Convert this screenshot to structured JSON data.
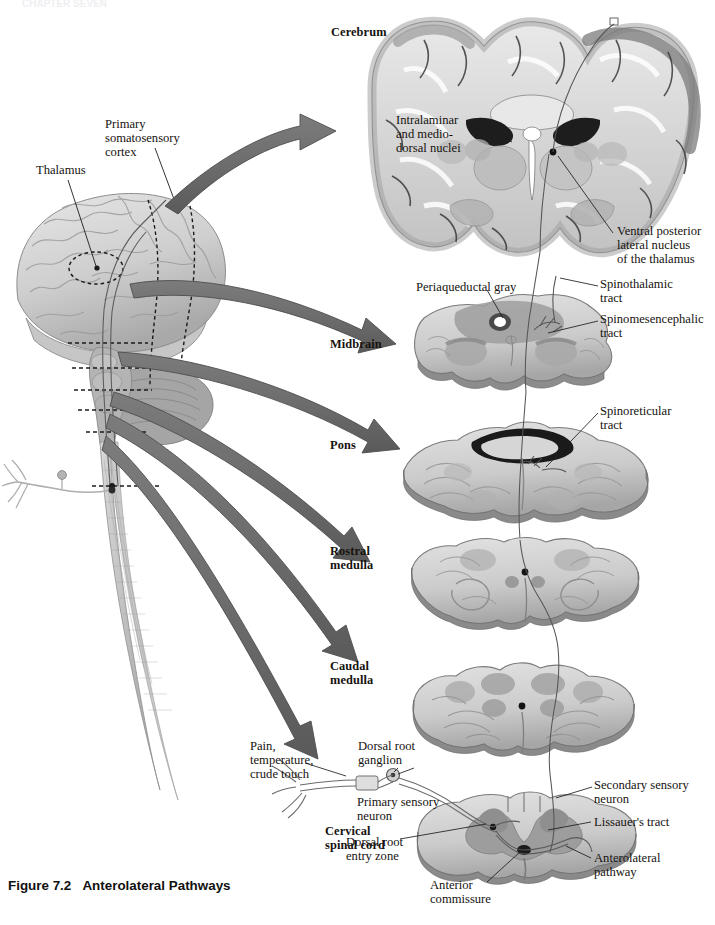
{
  "page": {
    "header_faint": "CHAPTER SEVEN",
    "caption_figure": "Figure 7.2",
    "caption_title": "Anterolateral Pathways",
    "background": "#ffffff"
  },
  "colors": {
    "arrow_fill": "#6f6f6f",
    "arrow_stroke": "#4a4a4a",
    "tissue_light": "#d9d9d9",
    "tissue_mid": "#bcbcbc",
    "tissue_dark": "#9a9a9a",
    "tissue_darker": "#7d7d7d",
    "leader_line": "#2b2b2b",
    "tract_line": "#555555",
    "text": "#16130f"
  },
  "brain_overview": {
    "name": "sagittal-brain-spinal-cord",
    "labels": [
      {
        "id": "thalamus",
        "text": "Thalamus",
        "x": 36,
        "y": 170
      },
      {
        "id": "primary-somatosensory-cortex",
        "text": "Primary\nsomatosensory\ncortex",
        "x": 105,
        "y": 122
      }
    ]
  },
  "level_labels": [
    {
      "id": "cerebrum",
      "text": "Cerebrum",
      "x": 331,
      "y": 30
    },
    {
      "id": "midbrain",
      "text": "Midbrain",
      "x": 330,
      "y": 340
    },
    {
      "id": "pons",
      "text": "Pons",
      "x": 330,
      "y": 440
    },
    {
      "id": "rostral-medulla",
      "text": "Rostral\nmedulla",
      "x": 330,
      "y": 548
    },
    {
      "id": "caudal-medulla",
      "text": "Caudal\nmedulla",
      "x": 330,
      "y": 663
    },
    {
      "id": "cervical-spinal-cord",
      "text": "Cervical\nspinal cord",
      "x": 325,
      "y": 828
    }
  ],
  "structure_labels": [
    {
      "id": "intralaminar-mediodorsal-nuclei",
      "text": "Intralaminar\nand medio-\ndorsal nuclei",
      "x": 396,
      "y": 118
    },
    {
      "id": "ventral-posterior-lateral-nucleus",
      "text": "Ventral posterior\nlateral nucleus\nof the thalamus",
      "x": 617,
      "y": 228
    },
    {
      "id": "periaqueductal-gray",
      "text": "Periaqueductal gray",
      "x": 416,
      "y": 284
    },
    {
      "id": "spinothalamic-tract",
      "text": "Spinothalamic\ntract",
      "x": 600,
      "y": 281
    },
    {
      "id": "spinomesencephalic-tract",
      "text": "Spinomesencephalic\ntract",
      "x": 600,
      "y": 316
    },
    {
      "id": "spinoreticular-tract",
      "text": "Spinoreticular\ntract",
      "x": 600,
      "y": 408
    },
    {
      "id": "pain-temperature-crude-touch",
      "text": "Pain,\ntemperature,\ncrude touch",
      "x": 250,
      "y": 743
    },
    {
      "id": "dorsal-root-ganglion",
      "text": "Dorsal root\nganglion",
      "x": 358,
      "y": 743
    },
    {
      "id": "primary-sensory-neuron",
      "text": "Primary sensory\nneuron",
      "x": 357,
      "y": 799
    },
    {
      "id": "dorsal-root-entry-zone",
      "text": "Dorsal root\nentry zone",
      "x": 346,
      "y": 839
    },
    {
      "id": "anterior-commissure",
      "text": "Anterior\ncommissure",
      "x": 430,
      "y": 882
    },
    {
      "id": "secondary-sensory-neuron",
      "text": "Secondary sensory\nneuron",
      "x": 594,
      "y": 782
    },
    {
      "id": "lissauers-tract",
      "text": "Lissauer's tract",
      "x": 594,
      "y": 819
    },
    {
      "id": "anterolateral-pathway",
      "text": "Anterolateral\npathway",
      "x": 594,
      "y": 855
    }
  ],
  "arrows": [
    {
      "id": "arrow-to-cerebrum",
      "from_level": "cortex",
      "to_level": "Cerebrum"
    },
    {
      "id": "arrow-to-midbrain",
      "from_level": "brainstem",
      "to_level": "Midbrain"
    },
    {
      "id": "arrow-to-pons",
      "from_level": "brainstem",
      "to_level": "Pons"
    },
    {
      "id": "arrow-to-rostral-medulla",
      "from_level": "brainstem",
      "to_level": "Rostral medulla"
    },
    {
      "id": "arrow-to-caudal-medulla",
      "from_level": "brainstem",
      "to_level": "Caudal medulla"
    },
    {
      "id": "arrow-to-spinal-cord",
      "from_level": "spinal-cord",
      "to_level": "Cervical spinal cord"
    }
  ],
  "sections": [
    {
      "id": "cerebrum-coronal-section",
      "level": "Cerebrum"
    },
    {
      "id": "midbrain-cross-section",
      "level": "Midbrain"
    },
    {
      "id": "pons-cross-section",
      "level": "Pons"
    },
    {
      "id": "rostral-medulla-cross-section",
      "level": "Rostral medulla"
    },
    {
      "id": "caudal-medulla-cross-section",
      "level": "Caudal medulla"
    },
    {
      "id": "cervical-spinal-cord-cross-section",
      "level": "Cervical spinal cord"
    }
  ]
}
